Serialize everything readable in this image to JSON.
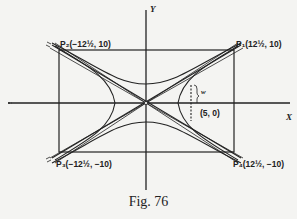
{
  "figure": {
    "caption": "Fig. 76",
    "axes": {
      "x_label": "X",
      "y_label": "Y"
    },
    "points": {
      "p1": "P₁(12½, 10)",
      "p2": "P₂(−12½, 10)",
      "p3": "P₃(−12½, −10)",
      "p4": "P₄(12½, −10)",
      "focus_point": "(5, 0)",
      "w_label": "w"
    },
    "colors": {
      "ink": "#222222",
      "paper": "#f4f4f2"
    }
  }
}
